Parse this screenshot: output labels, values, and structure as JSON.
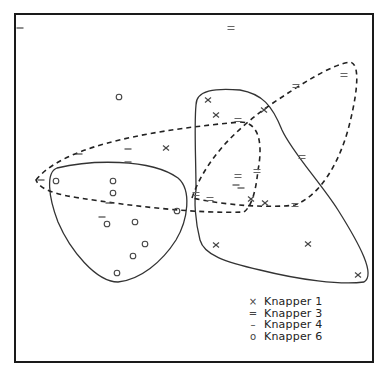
{
  "chart_data": {
    "type": "scatter",
    "title": "",
    "xlabel": "",
    "ylabel": "",
    "grid": false,
    "legend_position": "lower-right",
    "frame": {
      "x1": 15,
      "y1": 14,
      "x2": 373,
      "y2": 362
    },
    "series": [
      {
        "name": "Knapper 1",
        "marker": "x",
        "hull": "solid",
        "points": [
          [
            208,
            100
          ],
          [
            216,
            115
          ],
          [
            166,
            148
          ],
          [
            264,
            110
          ],
          [
            251,
            199
          ],
          [
            265,
            203
          ],
          [
            216,
            245
          ],
          [
            308,
            244
          ],
          [
            358,
            275
          ]
        ]
      },
      {
        "name": "Knapper 3",
        "marker": "=",
        "hull": "dashed",
        "points": [
          [
            231,
            28
          ],
          [
            344,
            75
          ],
          [
            296,
            86
          ],
          [
            238,
            120
          ],
          [
            257,
            171
          ],
          [
            238,
            176
          ],
          [
            196,
            194
          ],
          [
            210,
            199
          ],
          [
            295,
            205
          ],
          [
            302,
            157
          ]
        ]
      },
      {
        "name": "Knapper 4",
        "marker": "-",
        "hull": "dashed",
        "points": [
          [
            20,
            28
          ],
          [
            79,
            154
          ],
          [
            128,
            149
          ],
          [
            128,
            162
          ],
          [
            41,
            180
          ],
          [
            109,
            203
          ],
          [
            102,
            217
          ],
          [
            241,
            188
          ],
          [
            236,
            185
          ]
        ]
      },
      {
        "name": "Knapper 6",
        "marker": "o",
        "hull": "solid",
        "points": [
          [
            119,
            97
          ],
          [
            56,
            181
          ],
          [
            113,
            181
          ],
          [
            113,
            193
          ],
          [
            177,
            211
          ],
          [
            107,
            224
          ],
          [
            135,
            222
          ],
          [
            145,
            244
          ],
          [
            133,
            256
          ],
          [
            117,
            273
          ]
        ]
      }
    ]
  },
  "legend": {
    "items": [
      {
        "symbol": "×",
        "label": "Knapper 1"
      },
      {
        "symbol": "=",
        "label": "Knapper 3"
      },
      {
        "symbol": "–",
        "label": "Knapper 4"
      },
      {
        "symbol": "o",
        "label": "Knapper 6"
      }
    ]
  }
}
